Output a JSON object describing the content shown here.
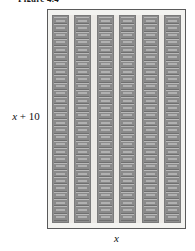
{
  "figure": {
    "caption": "Figure 4.4",
    "caption_clipped": true,
    "type": "area-model-rectangle",
    "fill_description": "unit tiles arranged in columns",
    "colors": {
      "page_background": "#ffffff",
      "rect_border": "#5a5a5a",
      "rect_fill": "#f3f3f0",
      "inner_fill": "#eceae6",
      "tile_fill": "#8a8a8a",
      "tile_column_fill": "#8e8e8e",
      "tile_highlight": "#d8d8d8",
      "label_color": "#111111"
    },
    "labels": {
      "height": {
        "expression": "x + 10",
        "variable": "x",
        "operator": "+",
        "constant": "10",
        "position": "left"
      },
      "width": {
        "expression": "x",
        "variable": "x",
        "position": "bottom"
      }
    },
    "grid": {
      "columns": 6,
      "rows": 28,
      "column_labels": [
        "col-1",
        "col-2",
        "col-3",
        "col-4",
        "col-5",
        "col-6"
      ]
    }
  }
}
